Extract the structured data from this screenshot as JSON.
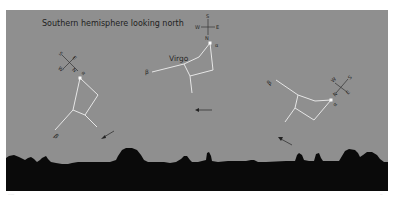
{
  "figure": {
    "title": "Southern hemisphere looking north",
    "background_color": "#8f8f8f",
    "horizon_color": "#0a0a0a",
    "line_color": "#e6e6e6",
    "constellation_name": "Virgo",
    "star_labels": {
      "alpha": "α",
      "beta": "β"
    },
    "compass": {
      "north": "N",
      "south": "S",
      "east": "E",
      "west": "W"
    },
    "panels": [
      {
        "position": "left",
        "motion_arrow": "down-left"
      },
      {
        "position": "center",
        "motion_arrow": "left"
      },
      {
        "position": "right",
        "motion_arrow": "up-left"
      }
    ]
  }
}
